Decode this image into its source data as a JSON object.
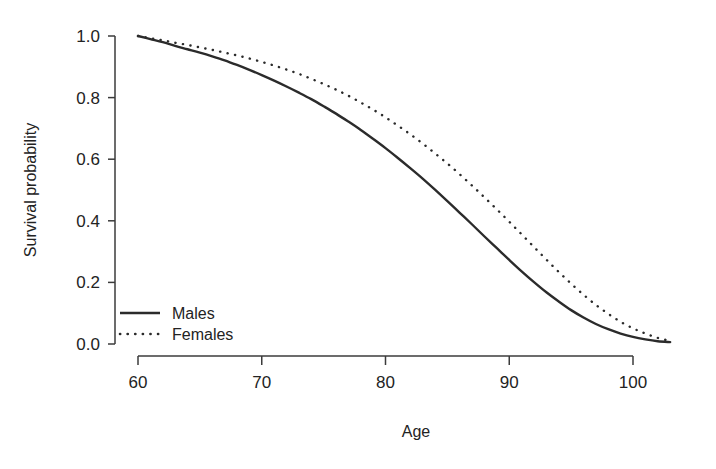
{
  "chart_data": {
    "type": "line",
    "title": "",
    "subtitle": "",
    "xlabel": "Age",
    "ylabel": "Survival probability",
    "xlim": [
      59,
      104
    ],
    "ylim": [
      0.0,
      1.0
    ],
    "xticks": [
      60,
      70,
      80,
      90,
      100
    ],
    "xtick_labels": [
      "60",
      "70",
      "80",
      "90",
      "100"
    ],
    "yticks": [
      0.0,
      0.2,
      0.4,
      0.6,
      0.8,
      1.0
    ],
    "ytick_labels": [
      "0.0",
      "0.2",
      "0.4",
      "0.6",
      "0.8",
      "1.0"
    ],
    "grid": false,
    "legend_position": "bottom-left",
    "x": [
      60,
      61,
      62,
      63,
      64,
      65,
      66,
      67,
      68,
      69,
      70,
      71,
      72,
      73,
      74,
      75,
      76,
      77,
      78,
      79,
      80,
      81,
      82,
      83,
      84,
      85,
      86,
      87,
      88,
      89,
      90,
      91,
      92,
      93,
      94,
      95,
      96,
      97,
      98,
      99,
      100,
      101,
      102,
      103
    ],
    "series": [
      {
        "name": "Males",
        "style": "solid",
        "color": "#2b2b2b",
        "values": [
          1.0,
          0.99,
          0.98,
          0.968,
          0.957,
          0.946,
          0.934,
          0.921,
          0.906,
          0.89,
          0.873,
          0.855,
          0.836,
          0.816,
          0.795,
          0.772,
          0.748,
          0.722,
          0.695,
          0.666,
          0.636,
          0.604,
          0.571,
          0.537,
          0.501,
          0.464,
          0.426,
          0.388,
          0.349,
          0.311,
          0.273,
          0.236,
          0.201,
          0.168,
          0.138,
          0.11,
          0.086,
          0.065,
          0.048,
          0.034,
          0.023,
          0.015,
          0.009,
          0.006
        ]
      },
      {
        "name": "Females",
        "style": "dotted",
        "color": "#2b2b2b",
        "values": [
          1.0,
          0.993,
          0.986,
          0.978,
          0.971,
          0.963,
          0.955,
          0.946,
          0.937,
          0.927,
          0.916,
          0.904,
          0.891,
          0.877,
          0.861,
          0.844,
          0.826,
          0.806,
          0.784,
          0.761,
          0.736,
          0.709,
          0.681,
          0.651,
          0.619,
          0.586,
          0.551,
          0.514,
          0.476,
          0.437,
          0.397,
          0.356,
          0.315,
          0.274,
          0.234,
          0.196,
          0.16,
          0.127,
          0.098,
          0.072,
          0.051,
          0.034,
          0.02,
          0.01
        ]
      }
    ]
  },
  "figure": {
    "axis_titles": {
      "x": "Age",
      "y": "Survival probability"
    },
    "legend": {
      "entries": [
        {
          "label": "Males",
          "style": "solid"
        },
        {
          "label": "Females",
          "style": "dotted"
        }
      ]
    },
    "ytick_labels": [
      "1.0",
      "0.8",
      "0.6",
      "0.4",
      "0.2",
      "0.0"
    ],
    "xtick_labels": [
      "60",
      "70",
      "80",
      "90",
      "100"
    ]
  }
}
